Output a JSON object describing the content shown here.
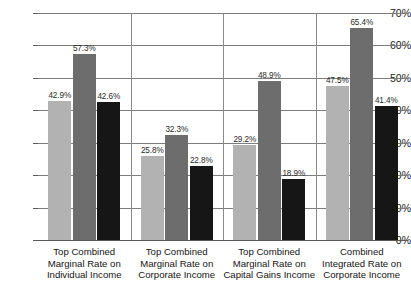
{
  "chart_data": {
    "type": "bar",
    "title": "",
    "xlabel": "",
    "ylabel": "",
    "ylim": [
      0,
      70
    ],
    "grid": true,
    "legend": "none",
    "ytick_labels": [
      "70%",
      "60%",
      "50%",
      "40%",
      "30%",
      "20%",
      "10%",
      "0%"
    ],
    "ytick_values": [
      70,
      60,
      50,
      40,
      30,
      20,
      10,
      0
    ],
    "categories": [
      "Top Combined Marginal Rate on Individual Income",
      "Top Combined Marginal Rate on Corporate Income",
      "Top Combined Marginal Rate on Capital Gains Income",
      "Combined Integrated Rate on Corporate Income"
    ],
    "category_lines": [
      [
        "Top Combined",
        "Marginal Rate on",
        "Individual Income"
      ],
      [
        "Top Combined",
        "Marginal Rate on",
        "Corporate Income"
      ],
      [
        "Top Combined",
        "Marginal Rate on",
        "Capital Gains Income"
      ],
      [
        "Combined",
        "Integrated Rate on",
        "Corporate Income"
      ]
    ],
    "series": [
      {
        "name": "series-1",
        "color": "#b2b2b2",
        "values": [
          42.9,
          25.8,
          29.2,
          47.5
        ],
        "labels": [
          "42.9%",
          "25.8%",
          "29.2%",
          "47.5%"
        ]
      },
      {
        "name": "series-2",
        "color": "#6d6d6d",
        "values": [
          57.3,
          32.3,
          48.9,
          65.4
        ],
        "labels": [
          "57.3%",
          "32.3%",
          "48.9%",
          "65.4%"
        ]
      },
      {
        "name": "series-3",
        "color": "#161616",
        "values": [
          42.6,
          22.8,
          18.9,
          41.4
        ],
        "labels": [
          "42.6%",
          "22.8%",
          "18.9%",
          "41.4%"
        ]
      }
    ]
  }
}
